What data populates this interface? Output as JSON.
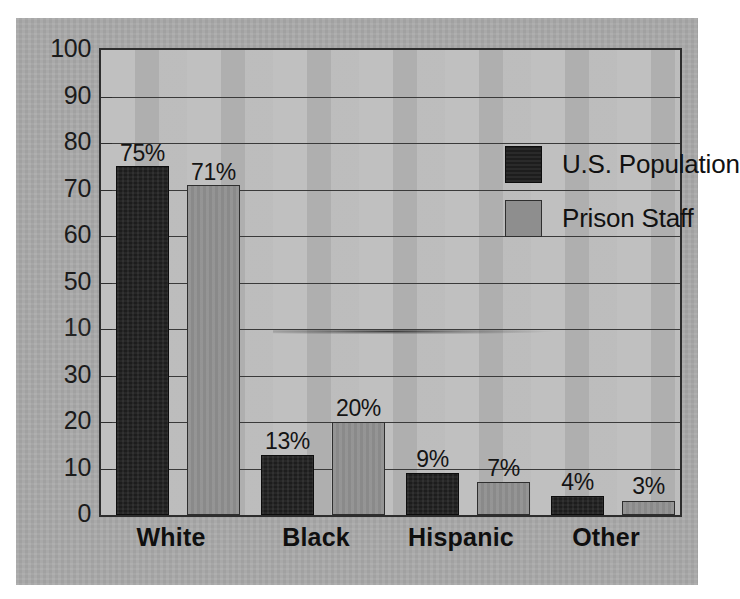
{
  "chart_data": {
    "type": "bar",
    "title": "",
    "subtitle": "",
    "xlabel": "",
    "ylabel": "",
    "ylim": [
      0,
      100
    ],
    "ytick_labels": [
      "100",
      "90",
      "80",
      "70",
      "60",
      "50",
      "40",
      "30",
      "20",
      "10",
      "0"
    ],
    "ytick_values": [
      100,
      90,
      80,
      70,
      60,
      50,
      40,
      30,
      20,
      10,
      0
    ],
    "ytick_step": 10,
    "grid": "horizontal",
    "legend_position": "top-right-inside",
    "categories": [
      "White",
      "Black",
      "Hispanic",
      "Other"
    ],
    "series": [
      {
        "name": "U.S. Population",
        "color": "#1d1d1d",
        "values": [
          75,
          13,
          9,
          4
        ],
        "data_labels": [
          "75%",
          "13%",
          "9%",
          "4%"
        ]
      },
      {
        "name": "Prison Staff",
        "color": "#8e8e8e",
        "values": [
          71,
          20,
          7,
          3
        ],
        "data_labels": [
          "71%",
          "20%",
          "7%",
          "3%"
        ]
      }
    ],
    "annotations": [
      "Y-axis label at the 40 gridline is degraded by a photocopy artifact and appears as '10'.",
      "A horizontal scanner smudge streak crosses the plot area near the 40 gridline."
    ]
  },
  "legend": {
    "items": [
      {
        "label": "U.S. Population",
        "swatch": "dark-swatch"
      },
      {
        "label": "Prison Staff",
        "swatch": "gray-swatch"
      }
    ]
  },
  "axis": {
    "y_labels": [
      {
        "text": "100",
        "value": 100,
        "degraded": false
      },
      {
        "text": "90",
        "value": 90,
        "degraded": false
      },
      {
        "text": "80",
        "value": 80,
        "degraded": false
      },
      {
        "text": "70",
        "value": 70,
        "degraded": false
      },
      {
        "text": "60",
        "value": 60,
        "degraded": false
      },
      {
        "text": "50",
        "value": 50,
        "degraded": false
      },
      {
        "text": "10",
        "value": 40,
        "degraded": true
      },
      {
        "text": "30",
        "value": 30,
        "degraded": false
      },
      {
        "text": "20",
        "value": 20,
        "degraded": false
      },
      {
        "text": "10",
        "value": 10,
        "degraded": false
      },
      {
        "text": "0",
        "value": 0,
        "degraded": false
      }
    ],
    "categories": [
      {
        "text": "White"
      },
      {
        "text": "Black"
      },
      {
        "text": "Hispanic"
      },
      {
        "text": "Other"
      }
    ]
  },
  "bars": [
    {
      "group": "White",
      "series": "U.S. Population",
      "value": 75,
      "label": "75%",
      "style": "dark"
    },
    {
      "group": "White",
      "series": "Prison Staff",
      "value": 71,
      "label": "71%",
      "style": "gray"
    },
    {
      "group": "Black",
      "series": "U.S. Population",
      "value": 13,
      "label": "13%",
      "style": "dark"
    },
    {
      "group": "Black",
      "series": "Prison Staff",
      "value": 20,
      "label": "20%",
      "style": "gray"
    },
    {
      "group": "Hispanic",
      "series": "U.S. Population",
      "value": 9,
      "label": "9%",
      "style": "dark"
    },
    {
      "group": "Hispanic",
      "series": "Prison Staff",
      "value": 7,
      "label": "7%",
      "style": "gray"
    },
    {
      "group": "Other",
      "series": "U.S. Population",
      "value": 4,
      "label": "4%",
      "style": "dark"
    },
    {
      "group": "Other",
      "series": "Prison Staff",
      "value": 3,
      "label": "3%",
      "style": "gray"
    }
  ],
  "colors": {
    "page_background": "#ffffff",
    "card_background": "#aaaaaa",
    "plot_background": "#b9b9b9",
    "frame": "#2d2d2d",
    "gridline": "#3a3a3a",
    "series_population": "#1d1d1d",
    "series_staff": "#8e8e8e",
    "text": "#111111"
  }
}
